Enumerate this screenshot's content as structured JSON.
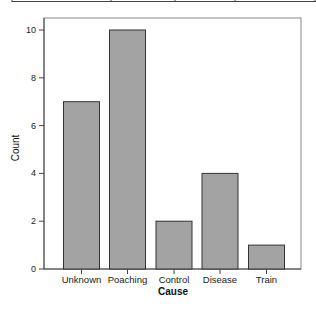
{
  "chart_data": {
    "type": "bar",
    "title": "",
    "xlabel": "Cause",
    "ylabel": "Count",
    "categories": [
      "Unknown",
      "Poaching",
      "Control",
      "Disease",
      "Train"
    ],
    "values": [
      7,
      10,
      2,
      4,
      1
    ],
    "ylim": [
      0,
      10
    ],
    "yticks": [
      0,
      2,
      4,
      6,
      8,
      10
    ],
    "grid": false,
    "legend": null,
    "bar_color": "#a3a3a3",
    "bar_edge_color": "#333333"
  },
  "labels": {
    "xlabel": "Cause",
    "ylabel": "Count",
    "yticks": [
      "0",
      "2",
      "4",
      "6",
      "8",
      "10"
    ],
    "categories": [
      "Unknown",
      "Poaching",
      "Control",
      "Disease",
      "Train"
    ]
  }
}
